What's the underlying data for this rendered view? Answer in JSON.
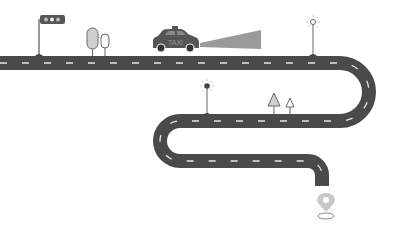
{
  "illustration": {
    "description": "Winding road route illustration with taxi, traffic light, trees, street lamps and destination pin",
    "taxi": {
      "label": "TAXI"
    },
    "colors": {
      "background": "#ffffff",
      "road": "#4a4a4a",
      "lane_marking": "#e6e6e6",
      "outline": "#555555",
      "fill_light": "#cfcfcf",
      "headlight_beam": "#9a9a9a",
      "pin": "#c8c8c8"
    },
    "elements": [
      "traffic-light",
      "trees",
      "taxi",
      "headlight-beam",
      "street-lamp",
      "street-lamp",
      "trees",
      "destination-pin"
    ]
  }
}
